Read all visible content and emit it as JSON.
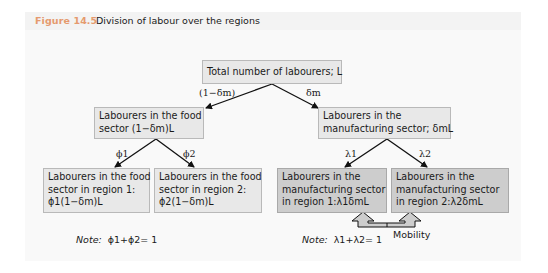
{
  "figure": {
    "label": "Figure 14.5",
    "title": "Division of labour over the regions",
    "label_color": "#e59a6e"
  },
  "nodes": {
    "total": {
      "lines": [
        "Total number of labourers; L"
      ]
    },
    "food": {
      "lines": [
        "Labourers in the food",
        "sector (1−δm)L"
      ]
    },
    "manufacturing": {
      "lines": [
        "Labourers in the",
        "manufacturing sector; δmL"
      ]
    },
    "food_region1": {
      "lines": [
        "Labourers in the food",
        "sector in region 1:",
        "ϕ1(1−δm)L"
      ]
    },
    "food_region2": {
      "lines": [
        "Labourers in the food",
        "sector in region 2:",
        "ϕ2(1−δm)L"
      ]
    },
    "manuf_region1": {
      "lines": [
        "Labourers in the",
        "manufacturing sector",
        "in region 1:λ1δmL"
      ]
    },
    "manuf_region2": {
      "lines": [
        "Labourers in the",
        "manufacturing sector",
        "in region 2:λ2δmL"
      ]
    }
  },
  "edges": {
    "total_to_food": "(1−δm)",
    "total_to_manufacturing": "δm",
    "food_to_region1": "ϕ1",
    "food_to_region2": "ϕ2",
    "manuf_to_region1": "λ1",
    "manuf_to_region2": "λ2"
  },
  "notes": {
    "food": {
      "prefix": "Note:",
      "formula": "ϕ1+ϕ2= 1"
    },
    "manufacturing": {
      "prefix": "Note:",
      "formula": "λ1+λ2= 1"
    }
  },
  "mobility": {
    "label": "Mobility"
  },
  "colors": {
    "box_light": "#e8e8e8",
    "box_dark": "#cdcdcd",
    "panel_bg": "#f9f9f9"
  }
}
